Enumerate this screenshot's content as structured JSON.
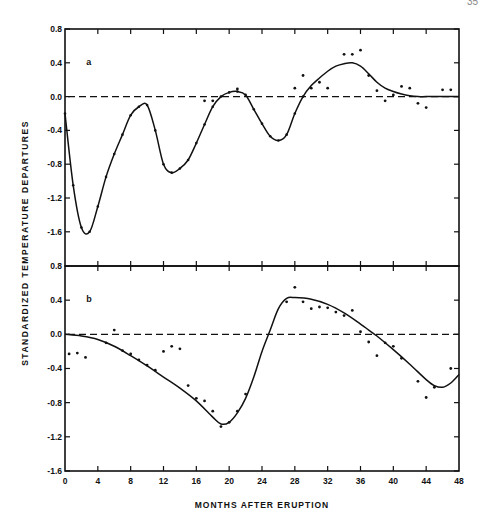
{
  "page": {
    "corner_number": "35"
  },
  "axes": {
    "ylabel": "STANDARDIZED   TEMPERATURE   DEPARTURES",
    "xlabel": "MONTHS AFTER ERUPTION",
    "x_ticks": [
      "0",
      "4",
      "8",
      "12",
      "16",
      "20",
      "24",
      "28",
      "32",
      "36",
      "40",
      "44",
      "48"
    ],
    "y_ticks": [
      "0.8",
      "0.4",
      "0.0",
      "-0.4",
      "-0.8",
      "-1.2",
      "-1.6"
    ]
  },
  "chart_data": [
    {
      "type": "line",
      "panel_label": "a",
      "xlabel": "MONTHS AFTER ERUPTION",
      "ylabel": "STANDARDIZED TEMPERATURE DEPARTURES",
      "xlim": [
        0,
        48
      ],
      "ylim": [
        -2.0,
        0.8
      ],
      "reference_line": {
        "y": 0.0,
        "style": "dashed"
      },
      "series": [
        {
          "name": "fitted curve",
          "style": "solid",
          "x": [
            0,
            1,
            2,
            3,
            4,
            5,
            6,
            7,
            8,
            9,
            10,
            11,
            12,
            13,
            14,
            15,
            16,
            17,
            18,
            19,
            20,
            21,
            22,
            23,
            24,
            25,
            26,
            27,
            28,
            29,
            30,
            31,
            32,
            33,
            34,
            35,
            36,
            37,
            38,
            39,
            40,
            41,
            42,
            43,
            44,
            46,
            48
          ],
          "y": [
            -0.2,
            -1.05,
            -1.55,
            -1.6,
            -1.3,
            -0.95,
            -0.68,
            -0.45,
            -0.22,
            -0.12,
            -0.1,
            -0.4,
            -0.8,
            -0.9,
            -0.85,
            -0.75,
            -0.55,
            -0.33,
            -0.12,
            0.0,
            0.05,
            0.06,
            0.02,
            -0.15,
            -0.32,
            -0.47,
            -0.52,
            -0.45,
            -0.2,
            0.0,
            0.13,
            0.22,
            0.3,
            0.36,
            0.39,
            0.4,
            0.36,
            0.27,
            0.17,
            0.1,
            0.06,
            0.03,
            0.01,
            0.0,
            0.0,
            0.0,
            0.0
          ]
        },
        {
          "name": "observed",
          "style": "points",
          "x": [
            17,
            18,
            21,
            28,
            29,
            30,
            31,
            32,
            34,
            35,
            36,
            37,
            38,
            39,
            40,
            41,
            42,
            43,
            44,
            46,
            47
          ],
          "y": [
            -0.05,
            -0.05,
            0.09,
            0.1,
            0.25,
            0.1,
            0.17,
            0.1,
            0.5,
            0.5,
            0.55,
            0.25,
            0.07,
            -0.05,
            0.02,
            0.12,
            0.1,
            -0.08,
            -0.13,
            0.08,
            0.08
          ]
        }
      ]
    },
    {
      "type": "line",
      "panel_label": "b",
      "xlabel": "MONTHS AFTER ERUPTION",
      "ylabel": "STANDARDIZED TEMPERATURE DEPARTURES",
      "xlim": [
        0,
        48
      ],
      "ylim": [
        -1.6,
        0.8
      ],
      "reference_line": {
        "y": 0.0,
        "style": "dashed"
      },
      "series": [
        {
          "name": "fitted curve",
          "style": "solid",
          "x": [
            0,
            2,
            4,
            6,
            8,
            10,
            12,
            14,
            16,
            18,
            19,
            20,
            21,
            22,
            23,
            24,
            25,
            26,
            27,
            28,
            30,
            32,
            34,
            36,
            37,
            38,
            40,
            42,
            44,
            45,
            46,
            47,
            48
          ],
          "y": [
            0.0,
            -0.02,
            -0.06,
            -0.14,
            -0.25,
            -0.37,
            -0.5,
            -0.63,
            -0.78,
            -0.97,
            -1.05,
            -1.03,
            -0.92,
            -0.75,
            -0.5,
            -0.2,
            0.05,
            0.3,
            0.42,
            0.43,
            0.41,
            0.35,
            0.25,
            0.12,
            0.05,
            -0.02,
            -0.18,
            -0.35,
            -0.53,
            -0.6,
            -0.62,
            -0.57,
            -0.47
          ]
        },
        {
          "name": "observed",
          "style": "points",
          "x": [
            0.5,
            1.5,
            2.5,
            5,
            6,
            7,
            8,
            9,
            10,
            11,
            12,
            13,
            14,
            15,
            16,
            17,
            18,
            19,
            20,
            21,
            22,
            27,
            28,
            29,
            30,
            31,
            32,
            33,
            34,
            35,
            36,
            37,
            38,
            39,
            40,
            41,
            43,
            44,
            45,
            47
          ],
          "y": [
            -0.23,
            -0.22,
            -0.27,
            -0.1,
            0.05,
            -0.19,
            -0.23,
            -0.3,
            -0.36,
            -0.42,
            -0.2,
            -0.14,
            -0.17,
            -0.6,
            -0.75,
            -0.78,
            -0.9,
            -1.08,
            -1.03,
            -0.9,
            -0.7,
            0.38,
            0.55,
            0.38,
            0.3,
            0.32,
            0.31,
            0.26,
            0.22,
            0.28,
            0.03,
            -0.09,
            -0.25,
            -0.1,
            -0.14,
            -0.28,
            -0.55,
            -0.74,
            -0.62,
            -0.4
          ]
        }
      ]
    }
  ]
}
